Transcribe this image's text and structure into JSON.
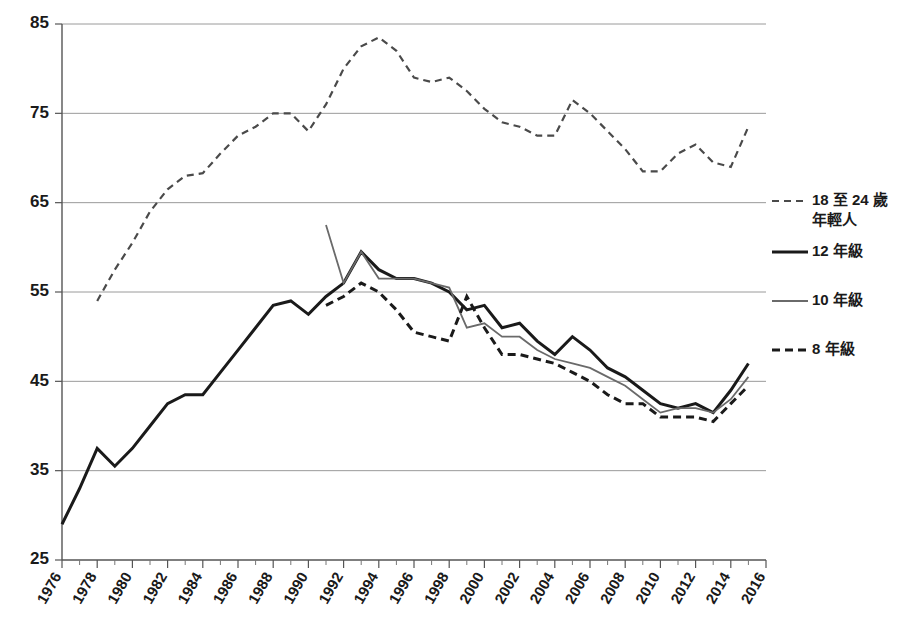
{
  "chart_data": {
    "type": "line",
    "title": "",
    "xlabel": "",
    "ylabel": "",
    "xlim": [
      1976,
      2016
    ],
    "ylim": [
      25,
      85
    ],
    "grid": true,
    "legend_position": "right",
    "y_ticks": [
      85,
      75,
      65,
      55,
      45,
      35,
      25
    ],
    "x_ticks": [
      1976,
      1978,
      1980,
      1982,
      1984,
      1986,
      1988,
      1990,
      1992,
      1994,
      1996,
      1998,
      2000,
      2002,
      2004,
      2006,
      2008,
      2010,
      2012,
      2014,
      2016
    ],
    "x_minor_ticks": [
      1977,
      1979,
      1981,
      1983,
      1985,
      1987,
      1989,
      1991,
      1993,
      1995,
      1997,
      1999,
      2001,
      2003,
      2005,
      2007,
      2009,
      2011,
      2013,
      2015
    ],
    "series": [
      {
        "name": "18 至 24 歲年輕人",
        "style": "dashed",
        "color": "#4a4a4a",
        "width": 2.2,
        "dash": "7,5",
        "x": [
          1978,
          1979,
          1980,
          1981,
          1982,
          1983,
          1984,
          1985,
          1986,
          1987,
          1988,
          1989,
          1990,
          1991,
          1992,
          1993,
          1994,
          1995,
          1996,
          1997,
          1998,
          1999,
          2000,
          2001,
          2002,
          2003,
          2004,
          2005,
          2006,
          2007,
          2008,
          2009,
          2010,
          2011,
          2012,
          2013,
          2014,
          2015
        ],
        "y": [
          54.0,
          57.5,
          60.5,
          64.0,
          66.5,
          68.0,
          68.3,
          70.5,
          72.5,
          73.5,
          75.0,
          75.0,
          73.0,
          76.0,
          80.0,
          82.5,
          83.5,
          82.0,
          79.0,
          78.5,
          79.0,
          77.5,
          75.5,
          74.0,
          73.5,
          72.5,
          72.5,
          76.5,
          75.0,
          73.0,
          71.0,
          68.5,
          68.5,
          70.5,
          71.5,
          69.5,
          69.0,
          73.5
        ]
      },
      {
        "name": "12 年級",
        "style": "solid",
        "color": "#1a1a1a",
        "width": 3.0,
        "dash": "",
        "x": [
          1976,
          1977,
          1978,
          1979,
          1980,
          1981,
          1982,
          1983,
          1984,
          1985,
          1986,
          1987,
          1988,
          1989,
          1990,
          1991,
          1992,
          1993,
          1994,
          1995,
          1996,
          1997,
          1998,
          1999,
          2000,
          2001,
          2002,
          2003,
          2004,
          2005,
          2006,
          2007,
          2008,
          2009,
          2010,
          2011,
          2012,
          2013,
          2014,
          2015
        ],
        "y": [
          29.0,
          33.0,
          37.5,
          35.5,
          37.5,
          40.0,
          42.5,
          43.5,
          43.5,
          46.0,
          48.5,
          51.0,
          53.5,
          54.0,
          52.5,
          54.5,
          56.0,
          59.5,
          57.5,
          56.5,
          56.5,
          56.0,
          55.0,
          53.0,
          53.5,
          51.0,
          51.5,
          49.5,
          48.0,
          50.0,
          48.5,
          46.5,
          45.5,
          44.0,
          42.5,
          42.0,
          42.5,
          41.5,
          44.0,
          47.0
        ]
      },
      {
        "name": "10 年級",
        "style": "solid",
        "color": "#6a6a6a",
        "width": 1.8,
        "dash": "",
        "x": [
          1991,
          1992,
          1993,
          1994,
          1995,
          1996,
          1997,
          1998,
          1999,
          2000,
          2001,
          2002,
          2003,
          2004,
          2005,
          2006,
          2007,
          2008,
          2009,
          2010,
          2011,
          2012,
          2013,
          2014,
          2015
        ],
        "y": [
          62.5,
          56.0,
          59.5,
          56.5,
          56.5,
          56.5,
          56.0,
          55.5,
          51.0,
          51.5,
          50.0,
          50.0,
          48.5,
          47.5,
          47.0,
          46.5,
          45.5,
          44.5,
          43.0,
          41.5,
          42.0,
          42.0,
          41.5,
          43.0,
          45.5
        ]
      },
      {
        "name": "8 年級",
        "style": "dashed",
        "color": "#1a1a1a",
        "width": 3.0,
        "dash": "8,5",
        "x": [
          1991,
          1992,
          1993,
          1994,
          1995,
          1996,
          1997,
          1998,
          1999,
          2000,
          2001,
          2002,
          2003,
          2004,
          2005,
          2006,
          2007,
          2008,
          2009,
          2010,
          2011,
          2012,
          2013,
          2014,
          2015
        ],
        "y": [
          53.5,
          54.5,
          56.0,
          55.0,
          53.0,
          50.5,
          50.0,
          49.5,
          54.5,
          51.0,
          48.0,
          48.0,
          47.5,
          47.0,
          46.0,
          45.0,
          43.5,
          42.5,
          42.5,
          41.0,
          41.0,
          41.0,
          40.5,
          42.5,
          44.5
        ]
      }
    ]
  },
  "legend": {
    "items": [
      {
        "label_line1": "18 至 24 歲",
        "label_line2": "年輕人",
        "key": "18-24-youth"
      },
      {
        "label_line1": "12 年級",
        "label_line2": "",
        "key": "grade-12"
      },
      {
        "label_line1": "10 年級",
        "label_line2": "",
        "key": "grade-10"
      },
      {
        "label_line1": "8 年級",
        "label_line2": "",
        "key": "grade-8"
      }
    ]
  }
}
